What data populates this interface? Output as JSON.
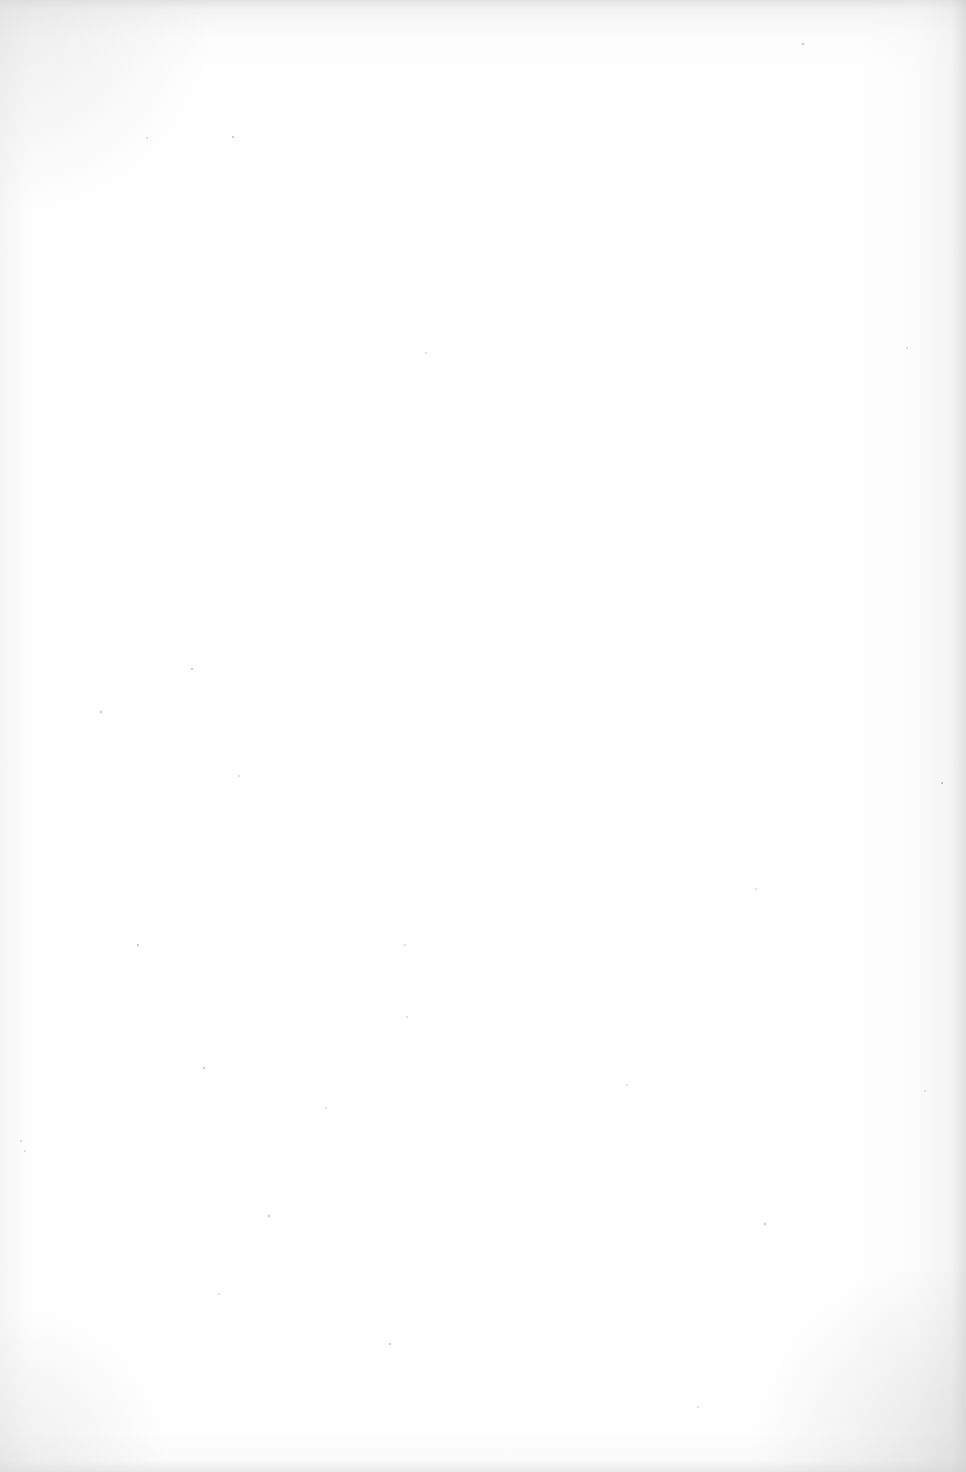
{
  "page": {
    "type": "blank scanned page",
    "content": "",
    "background_color": "#fefefe",
    "edge_shading_color": "#cdcdcd"
  }
}
